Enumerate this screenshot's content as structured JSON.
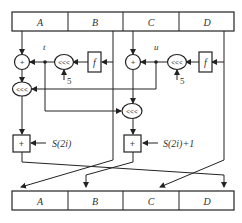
{
  "diagram": {
    "input_register": [
      "A",
      "B",
      "C",
      "D"
    ],
    "output_register": [
      "A",
      "B",
      "C",
      "D"
    ],
    "nodes": {
      "add_left": "+",
      "add_right": "+",
      "rot_left_mid": "<<<",
      "rot_right_mid": "<<<",
      "rot_left_low": "<<<",
      "rot_center": "<<<",
      "f_left": "f",
      "f_right": "f",
      "key_add_left": "+",
      "key_add_right": "+"
    },
    "labels": {
      "t": "t",
      "u": "u",
      "shift_left": "5",
      "shift_right": "5",
      "key_left": "S(2i)",
      "key_right": "S(2i)+1"
    }
  }
}
